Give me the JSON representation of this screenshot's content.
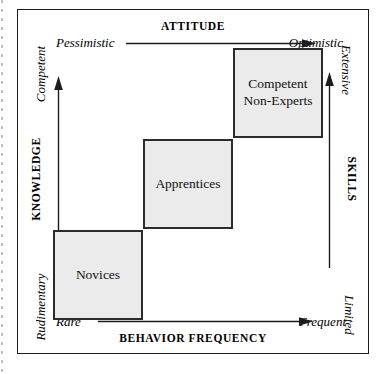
{
  "diagram": {
    "type": "2x2-style stepped matrix",
    "axes": {
      "top": {
        "title": "ATTITUDE",
        "low_label": "Pessimistic",
        "high_label": "Optimistic",
        "arrow": "right-arrow-icon"
      },
      "bottom": {
        "title": "BEHAVIOR FREQUENCY",
        "low_label": "Rare",
        "high_label": "Frequent",
        "arrow": "right-arrow-icon"
      },
      "left": {
        "title": "KNOWLEDGE",
        "low_label": "Rudimentary",
        "high_label": "Competent",
        "arrow": "up-arrow-icon"
      },
      "right": {
        "title": "SKILLS",
        "low_label": "Limited",
        "high_label": "Extensive",
        "arrow": "up-arrow-icon"
      }
    },
    "cells": [
      {
        "id": "novices",
        "lines": [
          "Novices"
        ]
      },
      {
        "id": "apprentices",
        "lines": [
          "Apprentices"
        ]
      },
      {
        "id": "competent-non-experts",
        "lines": [
          "Competent",
          "Non-Experts"
        ]
      }
    ],
    "colors": {
      "box_fill": "#ebebeb",
      "box_border": "#2b2b2b",
      "frame_border": "#1c1c1c",
      "text": "#101010",
      "background": "#ffffff"
    }
  }
}
